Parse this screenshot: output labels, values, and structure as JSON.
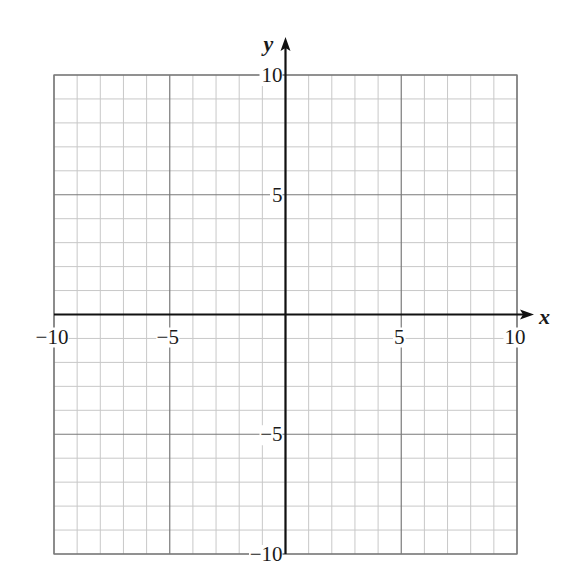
{
  "chart_data": {
    "type": "scatter",
    "title": "",
    "xlabel": "x",
    "ylabel": "y",
    "xlim": [
      -10,
      10
    ],
    "ylim": [
      -10,
      10
    ],
    "grid": true,
    "minor_grid_step": 1,
    "major_grid_step": 5,
    "x_ticks": [
      -10,
      -5,
      5,
      10
    ],
    "y_ticks": [
      10,
      5,
      -5,
      -10
    ],
    "x_tick_labels": [
      "−10",
      "−5",
      "5",
      "10"
    ],
    "y_tick_labels": [
      "10",
      "5",
      "−5",
      "−10"
    ],
    "series": [],
    "legend": null
  },
  "colors": {
    "minor_grid": "#c8c8c8",
    "major_grid": "#7a7a7a",
    "axis": "#111111",
    "text": "#1a1a1a"
  }
}
